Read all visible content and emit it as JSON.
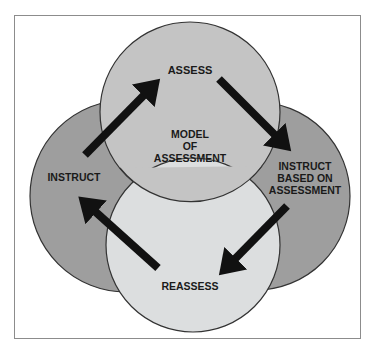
{
  "diagram": {
    "center_label": [
      "MODEL",
      "OF",
      "ASSESSMENT"
    ],
    "nodes": [
      {
        "id": "assess",
        "label": [
          "ASSESS"
        ],
        "fill": "#c4c4c4"
      },
      {
        "id": "instruct",
        "label": [
          "INSTRUCT"
        ],
        "fill": "#9e9e9e"
      },
      {
        "id": "instruct-based",
        "label": [
          "INSTRUCT",
          "BASED ON",
          "ASSESSMENT"
        ],
        "fill": "#9e9e9e"
      },
      {
        "id": "reassess",
        "label": [
          "REASSESS"
        ],
        "fill": "#dcdedf"
      }
    ],
    "edges": [
      {
        "from": "instruct",
        "to": "assess"
      },
      {
        "from": "assess",
        "to": "instruct-based"
      },
      {
        "from": "instruct-based",
        "to": "reassess"
      },
      {
        "from": "reassess",
        "to": "instruct"
      }
    ],
    "colors": {
      "arrow": "#111111",
      "outline": "#333333",
      "frame": "#8c8c8c"
    }
  }
}
